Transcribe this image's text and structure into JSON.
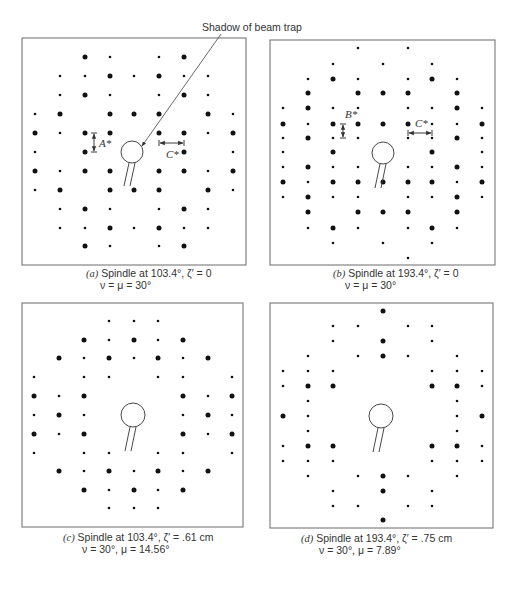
{
  "figure": {
    "callout": {
      "text": "Shadow of beam trap",
      "x": 202,
      "y": 31,
      "arrow_from": [
        221,
        34
      ],
      "arrow_to": [
        142,
        146
      ]
    },
    "panels": [
      {
        "id": "a",
        "label": "(a)",
        "caption_line1": "Spindle at 103.4°, ζ′ = 0",
        "caption_line2": "ν = μ = 30°",
        "caption_pos": {
          "x1": 86,
          "y1": 277,
          "x2": 100,
          "y2": 289
        },
        "frame": {
          "x": 22,
          "y": 38,
          "w": 224,
          "h": 227
        },
        "cols": [
          35,
          60,
          85,
          110,
          134,
          159,
          184,
          208,
          233
        ],
        "rows": [
          57,
          76,
          95,
          114,
          133,
          152,
          171,
          190,
          209,
          228,
          246
        ],
        "spots": [
          "..Ls.sL..",
          ".sLsLs.s.",
          ".Ls..Ls..",
          "sL.LLL.Ls",
          "LsLL.LL.L",
          "s.L...L.s",
          "LsLL.LL.L",
          "sL.LLL.Ls",
          ".Ls..Ls..",
          ".sLsLs.s.",
          "..Ls.sL.."
        ],
        "rows_note": "row strings use L=large spot, s=small spot, .=none; rows 1 & 3 & 7 & 9 are interpreted column-by-column below",
        "spot_grid": [
          [
            0,
            0,
            2,
            1,
            0,
            1,
            2,
            0,
            0
          ],
          [
            0,
            1,
            1,
            2,
            1,
            2,
            1,
            1,
            0
          ],
          [
            0,
            1,
            2,
            1,
            0,
            1,
            2,
            1,
            0
          ],
          [
            1,
            2,
            0,
            2,
            2,
            2,
            0,
            2,
            1
          ],
          [
            2,
            1,
            2,
            2,
            0,
            2,
            2,
            1,
            2
          ],
          [
            1,
            0,
            2,
            0,
            0,
            0,
            2,
            0,
            1
          ],
          [
            2,
            1,
            2,
            2,
            0,
            2,
            2,
            1,
            2
          ],
          [
            1,
            2,
            0,
            2,
            2,
            2,
            0,
            2,
            1
          ],
          [
            0,
            1,
            2,
            1,
            0,
            1,
            2,
            1,
            0
          ],
          [
            0,
            1,
            1,
            2,
            1,
            2,
            1,
            1,
            0
          ],
          [
            0,
            0,
            2,
            1,
            0,
            1,
            2,
            0,
            0
          ]
        ],
        "beam_trap": {
          "cx": 132,
          "cy": 152,
          "r": 11,
          "stem": [
            [
              129,
              163,
              124,
              186
            ],
            [
              135,
              163,
              130,
              186
            ]
          ]
        },
        "dimensions": [
          {
            "name": "A*",
            "orient": "v",
            "x": 94,
            "y1": 133,
            "y2": 152,
            "label_x": 99,
            "label_y": 147
          },
          {
            "name": "C*",
            "orient": "h",
            "y": 143,
            "x1": 159,
            "x2": 184,
            "label_x": 166,
            "label_y": 158
          }
        ]
      },
      {
        "id": "b",
        "label": "(b)",
        "caption_line1": "Spindle at 193.4°, ζ′ = 0",
        "caption_line2": "ν = μ = 30°",
        "caption_pos": {
          "x1": 333,
          "y1": 277,
          "x2": 345,
          "y2": 289
        },
        "frame": {
          "x": 270,
          "y": 40,
          "w": 225,
          "h": 225
        },
        "cols": [
          283,
          308,
          333,
          358,
          383,
          408,
          432,
          457,
          482
        ],
        "rows": [
          48,
          64,
          79,
          93,
          108,
          124,
          138,
          152,
          167,
          182,
          197,
          212,
          228,
          243,
          258
        ],
        "spot_grid": [
          [
            0,
            0,
            0,
            1,
            0,
            1,
            0,
            0,
            0
          ],
          [
            0,
            0,
            1,
            0,
            1,
            0,
            1,
            0,
            0
          ],
          [
            0,
            1,
            2,
            1,
            0,
            1,
            2,
            1,
            0
          ],
          [
            0,
            2,
            0,
            2,
            2,
            2,
            0,
            2,
            0
          ],
          [
            1,
            2,
            1,
            1,
            0,
            1,
            1,
            2,
            1
          ],
          [
            2,
            1,
            2,
            2,
            2,
            2,
            1,
            1,
            2
          ],
          [
            1,
            2,
            1,
            1,
            0,
            1,
            1,
            2,
            1
          ],
          [
            1,
            0,
            2,
            0,
            0,
            0,
            2,
            0,
            1
          ],
          [
            1,
            2,
            1,
            1,
            0,
            1,
            1,
            2,
            1
          ],
          [
            2,
            1,
            2,
            2,
            2,
            2,
            2,
            1,
            2
          ],
          [
            1,
            2,
            1,
            1,
            0,
            1,
            1,
            2,
            1
          ],
          [
            0,
            2,
            0,
            2,
            2,
            2,
            0,
            2,
            0
          ],
          [
            0,
            1,
            2,
            1,
            0,
            1,
            2,
            1,
            0
          ],
          [
            0,
            0,
            1,
            0,
            1,
            0,
            1,
            0,
            0
          ],
          [
            0,
            0,
            0,
            0,
            0,
            1,
            0,
            0,
            0
          ]
        ],
        "beam_trap": {
          "cx": 383,
          "cy": 153,
          "r": 11,
          "stem": [
            [
              380,
              164,
              375,
              188
            ],
            [
              386,
              164,
              381,
              188
            ]
          ]
        },
        "dimensions": [
          {
            "name": "B*",
            "orient": "v",
            "x": 343,
            "y1": 124,
            "y2": 138,
            "label_x": 345,
            "label_y": 118
          },
          {
            "name": "C*",
            "orient": "h",
            "y": 133,
            "x1": 408,
            "x2": 432,
            "label_x": 415,
            "label_y": 127
          }
        ]
      },
      {
        "id": "c",
        "label": "(c)",
        "caption_line1": "Spindle at 103.4°, ζ′ = .61 cm",
        "caption_line2": "ν  = 30°, μ  = 14.56°",
        "caption_pos": {
          "x1": 63,
          "y1": 541,
          "x2": 82,
          "y2": 553
        },
        "frame": {
          "x": 22,
          "y": 303,
          "w": 221,
          "h": 224
        },
        "cols": [
          34,
          59,
          84,
          109,
          134,
          158,
          183,
          208,
          232
        ],
        "rows": [
          321,
          340,
          358,
          377,
          396,
          415,
          434,
          453,
          471,
          490,
          508
        ],
        "spot_grid": [
          [
            0,
            0,
            0,
            1,
            1,
            1,
            0,
            0,
            0
          ],
          [
            0,
            0,
            2,
            1,
            2,
            1,
            2,
            0,
            0
          ],
          [
            0,
            2,
            1,
            2,
            1,
            2,
            1,
            2,
            0
          ],
          [
            1,
            0,
            1,
            1,
            0,
            1,
            1,
            0,
            1
          ],
          [
            2,
            1,
            2,
            0,
            0,
            0,
            2,
            1,
            2
          ],
          [
            1,
            2,
            1,
            0,
            0,
            0,
            1,
            2,
            1
          ],
          [
            2,
            1,
            2,
            0,
            0,
            0,
            2,
            1,
            2
          ],
          [
            1,
            0,
            1,
            1,
            0,
            1,
            1,
            0,
            1
          ],
          [
            0,
            2,
            1,
            2,
            1,
            2,
            1,
            2,
            0
          ],
          [
            0,
            0,
            2,
            1,
            2,
            1,
            2,
            0,
            0
          ],
          [
            0,
            0,
            0,
            1,
            1,
            1,
            0,
            0,
            0
          ]
        ],
        "beam_trap": {
          "cx": 133,
          "cy": 415,
          "r": 12,
          "stem": [
            [
              130,
              427,
              125,
              451
            ],
            [
              136,
              427,
              131,
              451
            ]
          ]
        },
        "dimensions": []
      },
      {
        "id": "d",
        "label": "(d)",
        "caption_line1": "Spindle at 193.4°, ζ′ = .75 cm",
        "caption_line2": "ν  = 30°, μ  = 7.89°",
        "caption_pos": {
          "x1": 301,
          "y1": 542,
          "x2": 319,
          "y2": 554
        },
        "frame": {
          "x": 270,
          "y": 303,
          "w": 223,
          "h": 225
        },
        "cols": [
          283,
          308,
          333,
          358,
          383,
          408,
          432,
          457,
          482
        ],
        "rows": [
          311,
          326,
          341,
          356,
          371,
          386,
          401,
          416,
          431,
          446,
          461,
          476,
          491,
          506,
          520
        ],
        "spot_grid": [
          [
            0,
            0,
            0,
            0,
            2,
            0,
            0,
            0,
            0
          ],
          [
            0,
            0,
            1,
            1,
            0,
            1,
            1,
            0,
            0
          ],
          [
            0,
            0,
            1,
            0,
            2,
            0,
            1,
            0,
            0
          ],
          [
            0,
            1,
            0,
            1,
            2,
            1,
            0,
            1,
            0
          ],
          [
            1,
            1,
            1,
            0,
            0,
            0,
            1,
            1,
            1
          ],
          [
            1,
            2,
            2,
            0,
            0,
            0,
            2,
            2,
            1
          ],
          [
            0,
            1,
            0,
            0,
            0,
            0,
            0,
            1,
            0
          ],
          [
            2,
            1,
            0,
            0,
            0,
            0,
            0,
            1,
            2
          ],
          [
            0,
            1,
            0,
            0,
            0,
            0,
            0,
            1,
            0
          ],
          [
            1,
            2,
            2,
            0,
            0,
            0,
            2,
            2,
            1
          ],
          [
            1,
            1,
            1,
            0,
            0,
            0,
            1,
            1,
            1
          ],
          [
            0,
            1,
            0,
            1,
            2,
            1,
            0,
            1,
            0
          ],
          [
            0,
            0,
            1,
            0,
            2,
            0,
            1,
            0,
            0
          ],
          [
            0,
            0,
            1,
            1,
            0,
            1,
            1,
            0,
            0
          ],
          [
            0,
            0,
            0,
            0,
            2,
            0,
            0,
            0,
            0
          ]
        ],
        "beam_trap": {
          "cx": 381,
          "cy": 416,
          "r": 12,
          "stem": [
            [
              378,
              428,
              373,
              452
            ],
            [
              384,
              428,
              379,
              452
            ]
          ]
        },
        "dimensions": []
      }
    ],
    "spot_radius": {
      "small": 1.3,
      "large": 2.5
    }
  }
}
